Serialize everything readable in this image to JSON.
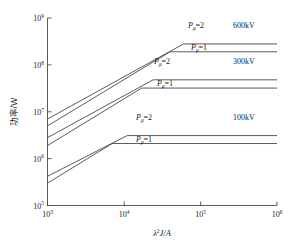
{
  "chart_data": {
    "type": "line",
    "title": "",
    "xlabel": "λ²J/A",
    "ylabel": "功率/W",
    "xscale": "log",
    "yscale": "log",
    "xlim": [
      1000,
      1000000
    ],
    "ylim": [
      100000,
      1000000000
    ],
    "grid": false,
    "legend_position": "inline-annotations",
    "xticks": [
      1000,
      10000,
      100000,
      1000000
    ],
    "xticklabels": [
      "10³",
      "10⁴",
      "10⁵",
      "10⁶"
    ],
    "yticks": [
      100000,
      1000000,
      10000000,
      100000000,
      1000000000
    ],
    "yticklabels": [
      "10⁵",
      "10⁶",
      "10⁷",
      "10⁸",
      "10⁹"
    ],
    "series": [
      {
        "name": "600kV Pμ=2",
        "group": "600kV",
        "pmu": 2,
        "x": [
          1000,
          60000,
          1000000
        ],
        "y": [
          7000000,
          280000000,
          280000000
        ],
        "knee_x": 60000,
        "plateau_y": 280000000
      },
      {
        "name": "600kV Pμ=1",
        "group": "600kV",
        "pmu": 1,
        "x": [
          1000,
          40000,
          1000000
        ],
        "y": [
          5000000,
          190000000,
          190000000
        ],
        "knee_x": 40000,
        "plateau_y": 190000000
      },
      {
        "name": "300kV Pμ=2",
        "group": "300kV",
        "pmu": 2,
        "x": [
          1000,
          24000,
          1000000
        ],
        "y": [
          2800000,
          48000000,
          48000000
        ],
        "knee_x": 24000,
        "plateau_y": 48000000
      },
      {
        "name": "300kV Pμ=1",
        "group": "300kV",
        "pmu": 1,
        "x": [
          1000,
          17000,
          1000000
        ],
        "y": [
          1900000,
          32000000,
          32000000
        ],
        "knee_x": 17000,
        "plateau_y": 32000000
      },
      {
        "name": "100kV Pμ=2",
        "group": "100kV",
        "pmu": 2,
        "x": [
          1000,
          11000,
          1000000
        ],
        "y": [
          420000,
          3100000,
          3100000
        ],
        "knee_x": 11000,
        "plateau_y": 3100000
      },
      {
        "name": "100kV Pμ=1",
        "group": "100kV",
        "pmu": 1,
        "x": [
          1000,
          7000,
          1000000
        ],
        "y": [
          300000,
          2100000,
          2100000
        ],
        "knee_x": 7000,
        "plateau_y": 2100000
      }
    ],
    "annotations": [
      {
        "id": "a600-p2",
        "text_var": "P",
        "text_sub": "μ",
        "text_eq": "=2",
        "group": "600kV"
      },
      {
        "id": "a600-p1",
        "text_var": "P",
        "text_sub": "μ",
        "text_eq": "=1",
        "group": "600kV"
      },
      {
        "id": "a300-p2",
        "text_var": "P",
        "text_sub": "μ",
        "text_eq": "=2",
        "group": "300kV"
      },
      {
        "id": "a300-p1",
        "text_var": "P",
        "text_sub": "μ",
        "text_eq": "=1",
        "group": "300kV"
      },
      {
        "id": "a100-p2",
        "text_var": "P",
        "text_sub": "μ",
        "text_eq": "=2",
        "group": "100kV"
      },
      {
        "id": "a100-p1",
        "text_var": "P",
        "text_sub": "μ",
        "text_eq": "=1",
        "group": "100kV"
      }
    ],
    "group_labels": [
      "600kV",
      "300kV",
      "100kV"
    ]
  },
  "axes": {
    "y_title": "功率/W",
    "x_title_lambda": "λ",
    "x_title_sup": "2",
    "x_title_rest": "J/A",
    "ytick_0": "10",
    "ytick_0_exp": "9",
    "ytick_1": "10",
    "ytick_1_exp": "8",
    "ytick_2": "10",
    "ytick_2_exp": "7",
    "ytick_3": "10",
    "ytick_3_exp": "6",
    "ytick_4": "10",
    "ytick_4_exp": "5",
    "xtick_0": "10",
    "xtick_0_exp": "3",
    "xtick_1": "10",
    "xtick_1_exp": "4",
    "xtick_2": "10",
    "xtick_2_exp": "5",
    "xtick_3": "10",
    "xtick_3_exp": "6"
  },
  "annotations": {
    "p_symbol": "P",
    "p_subscript": "μ",
    "eq2": "=2",
    "eq1": "=1",
    "label_600": "600kV",
    "label_300": "300kV",
    "label_100": "100kV"
  }
}
